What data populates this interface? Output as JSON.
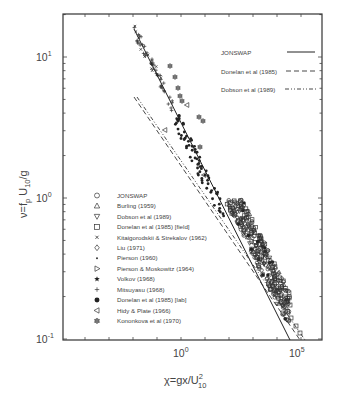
{
  "chart_data": {
    "type": "scatter",
    "title": "",
    "xlabel": "χ=gx/U_10^2",
    "ylabel": "ν=f_p U_10/g",
    "xscale": "log",
    "yscale": "log",
    "xlim": [
      1e-05,
      1000000.0
    ],
    "ylim": [
      0.1,
      20
    ],
    "x_ticks": [
      "10^0",
      "10^5"
    ],
    "y_ticks": [
      "10^-1",
      "10^0",
      "10^1"
    ],
    "grid": false,
    "legend_position": "inside-lower-left (markers), inside-upper-right (lines)",
    "lines": [
      {
        "name": "JONSWAP",
        "style": "solid",
        "points": [
          [
            0.011,
            15.8
          ],
          [
            35000,
            0.098
          ]
        ]
      },
      {
        "name": "Donelan et al (1985)",
        "style": "dashed",
        "points": [
          [
            0.011,
            5.2
          ],
          [
            91000,
            0.098
          ]
        ]
      },
      {
        "name": "Dobson et al (1989)",
        "style": "dash-dot-dot",
        "points": [
          [
            0.011,
            5.0
          ],
          [
            150000,
            0.098
          ]
        ]
      }
    ],
    "series": [
      {
        "name": "JONSWAP",
        "marker": "circle-open",
        "region": "dense cluster log10χ 2.5–4.5, ν 0.2–0.9"
      },
      {
        "name": "Burling (1959)",
        "marker": "triangle-up-open"
      },
      {
        "name": "Dobson et al (1989)",
        "marker": "triangle-down-open"
      },
      {
        "name": "Donelan et al (1985) [field]",
        "marker": "square-open",
        "region": "log10χ 3.5–4.7, ν 0.12–0.35"
      },
      {
        "name": "Kitaigorodskii & Strekalov (1962)",
        "marker": "x-small"
      },
      {
        "name": "Liu (1971)",
        "marker": "diamond-open"
      },
      {
        "name": "Pierson (1960)",
        "marker": "dot"
      },
      {
        "name": "Pierson & Moskowitz (1964)",
        "marker": "triangle-right-open"
      },
      {
        "name": "Volkov (1968)",
        "marker": "star-filled"
      },
      {
        "name": "Mitsuyasu (1968)",
        "marker": "plus",
        "region": "log10χ −2 to 0, ν 2–15"
      },
      {
        "name": "Donelan et al (1985) [lab]",
        "marker": "circle-filled",
        "region": "log10χ 0–2.5, ν 0.6–2"
      },
      {
        "name": "Hidy & Plate (1966)",
        "marker": "triangle-left-open"
      },
      {
        "name": "Kononkova et al (1970)",
        "marker": "hexagon-star",
        "region": "log10χ 0–1.3, ν 3–9"
      }
    ]
  },
  "axes": {
    "x_tick_labels": [
      {
        "base": "10",
        "exp": "0"
      },
      {
        "base": "10",
        "exp": "5"
      }
    ],
    "y_tick_labels": [
      {
        "base": "10",
        "exp": "1"
      },
      {
        "base": "10",
        "exp": "0"
      },
      {
        "base": "10",
        "exp": "-1"
      }
    ],
    "xlabel": {
      "main": "χ=gx/U",
      "sup": "2",
      "sub": "10"
    },
    "ylabel": {
      "pre": "ν=f",
      "sub1": "p",
      "mid": " U",
      "sub2": "10",
      "post": "/g"
    }
  },
  "line_legend": [
    {
      "label": "JONSWAP",
      "style": "solid"
    },
    {
      "label": "Donelan et al (1985)",
      "style": "dashed"
    },
    {
      "label": "Dobson et al (1989)",
      "style": "dash-dot-dot"
    }
  ],
  "marker_legend": [
    {
      "label": "JONSWAP",
      "marker": "circle-open"
    },
    {
      "label": "Burling (1959)",
      "marker": "triangle-up-open"
    },
    {
      "label": "Dobson et al (1989)",
      "marker": "triangle-down-open"
    },
    {
      "label": "Donelan et al (1985) [field]",
      "marker": "square-open"
    },
    {
      "label": "Kitaigorodskii & Strekalov (1962)",
      "marker": "x-small"
    },
    {
      "label": "Liu (1971)",
      "marker": "diamond-open"
    },
    {
      "label": "Pierson (1960)",
      "marker": "dot"
    },
    {
      "label": "Pierson & Moskowitz (1964)",
      "marker": "triangle-right-open"
    },
    {
      "label": "Volkov (1968)",
      "marker": "star-filled"
    },
    {
      "label": "Mitsuyasu (1968)",
      "marker": "plus"
    },
    {
      "label": "Donelan et al (1985) [lab]",
      "marker": "circle-filled"
    },
    {
      "label": "Hidy & Plate (1966)",
      "marker": "triangle-left-open"
    },
    {
      "label": "Kononkova et al (1970)",
      "marker": "hexagon-star"
    }
  ],
  "colors": {
    "ink": "#333333",
    "text": "#444444",
    "background": "#ffffff"
  }
}
